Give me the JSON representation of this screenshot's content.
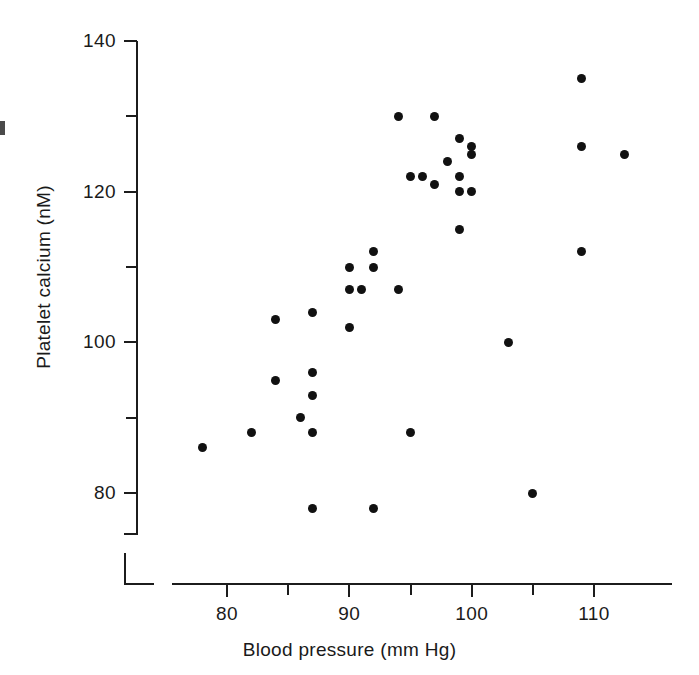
{
  "chart_data": {
    "type": "scatter",
    "title": "",
    "xlabel": "Blood pressure (mm Hg)",
    "ylabel": "Platelet calcium (nM)",
    "xlim": [
      77,
      113.5
    ],
    "ylim": [
      76,
      140
    ],
    "grid": false,
    "legend": null,
    "marker": {
      "shape": "circle",
      "color": "#111111",
      "size": 9
    },
    "xticks": [
      80,
      90,
      100,
      110
    ],
    "xticks_minor": [
      85,
      95,
      105
    ],
    "xtick_labels": [
      "80",
      "90",
      "100",
      "110"
    ],
    "yticks": [
      80,
      100,
      120,
      140
    ],
    "yticks_minor": [
      90,
      110,
      130
    ],
    "ytick_labels": [
      "80",
      "100",
      "120",
      "140"
    ],
    "x": [
      78,
      82,
      84,
      84,
      86,
      87,
      87,
      87,
      87,
      87,
      90,
      90,
      90,
      91,
      92,
      92,
      92,
      94,
      94,
      95,
      95,
      96,
      97,
      97,
      98,
      99,
      99,
      99,
      99,
      100,
      100,
      100,
      103,
      105,
      109,
      109,
      109,
      112.5
    ],
    "y": [
      86,
      88,
      95,
      103,
      90,
      78,
      88,
      93,
      96,
      104,
      102,
      107,
      110,
      107,
      78,
      110,
      112,
      107,
      130,
      88,
      122,
      122,
      121,
      130,
      124,
      115,
      120,
      122,
      127,
      120,
      125,
      126,
      100,
      80,
      112,
      126,
      135,
      125
    ],
    "points": [
      {
        "x": 78,
        "y": 86
      },
      {
        "x": 82,
        "y": 88
      },
      {
        "x": 84,
        "y": 95
      },
      {
        "x": 84,
        "y": 103
      },
      {
        "x": 86,
        "y": 90
      },
      {
        "x": 87,
        "y": 78
      },
      {
        "x": 87,
        "y": 88
      },
      {
        "x": 87,
        "y": 93
      },
      {
        "x": 87,
        "y": 96
      },
      {
        "x": 87,
        "y": 104
      },
      {
        "x": 90,
        "y": 102
      },
      {
        "x": 90,
        "y": 107
      },
      {
        "x": 90,
        "y": 110
      },
      {
        "x": 91,
        "y": 107
      },
      {
        "x": 92,
        "y": 78
      },
      {
        "x": 92,
        "y": 110
      },
      {
        "x": 92,
        "y": 112
      },
      {
        "x": 94,
        "y": 107
      },
      {
        "x": 94,
        "y": 130
      },
      {
        "x": 95,
        "y": 88
      },
      {
        "x": 95,
        "y": 122
      },
      {
        "x": 96,
        "y": 122
      },
      {
        "x": 97,
        "y": 121
      },
      {
        "x": 97,
        "y": 130
      },
      {
        "x": 98,
        "y": 124
      },
      {
        "x": 99,
        "y": 115
      },
      {
        "x": 99,
        "y": 120
      },
      {
        "x": 99,
        "y": 122
      },
      {
        "x": 99,
        "y": 127
      },
      {
        "x": 100,
        "y": 120
      },
      {
        "x": 100,
        "y": 125
      },
      {
        "x": 100,
        "y": 126
      },
      {
        "x": 103,
        "y": 100
      },
      {
        "x": 105,
        "y": 80
      },
      {
        "x": 109,
        "y": 112
      },
      {
        "x": 109,
        "y": 126
      },
      {
        "x": 109,
        "y": 135
      },
      {
        "x": 112.5,
        "y": 125
      }
    ]
  },
  "axes": {
    "x_title": "Blood pressure (mm Hg)",
    "y_title": "Platelet calcium (nM)"
  },
  "colors": {
    "marker": "#111111",
    "axis": "#1c1c1c",
    "text": "#1a1a1a",
    "background": "#ffffff"
  }
}
